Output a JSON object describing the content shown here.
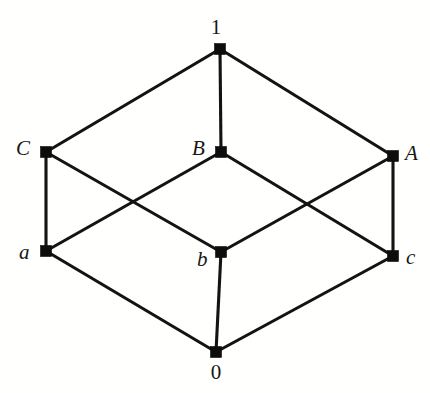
{
  "figure": {
    "background_color": "#ffffff",
    "node_color": "#0d0d0d",
    "edge_color": "#131313",
    "width": 430,
    "height": 393
  },
  "chart_data": {
    "type": "diagram",
    "subtype": "hasse-diagram",
    "nodes": [
      {
        "id": "top",
        "label": "1",
        "style": "upright",
        "x": 220,
        "y": 49,
        "label_x": 216,
        "label_y": 17,
        "label_align": "center"
      },
      {
        "id": "C",
        "label": "C",
        "style": "italic",
        "x": 46,
        "y": 152,
        "label_x": 16,
        "label_y": 138,
        "label_align": "left"
      },
      {
        "id": "B",
        "label": "B",
        "style": "italic",
        "x": 221,
        "y": 152,
        "label_x": 192,
        "label_y": 138,
        "label_align": "left"
      },
      {
        "id": "A",
        "label": "A",
        "style": "italic",
        "x": 393,
        "y": 156,
        "label_x": 405,
        "label_y": 143,
        "label_align": "left"
      },
      {
        "id": "a",
        "label": "a",
        "style": "italic",
        "x": 46,
        "y": 251,
        "label_x": 19,
        "label_y": 242,
        "label_align": "left"
      },
      {
        "id": "b",
        "label": "b",
        "style": "italic",
        "x": 221,
        "y": 252,
        "label_x": 197,
        "label_y": 249,
        "label_align": "left"
      },
      {
        "id": "c",
        "label": "c",
        "style": "italic",
        "x": 393,
        "y": 256,
        "label_x": 406,
        "label_y": 247,
        "label_align": "left"
      },
      {
        "id": "bottom",
        "label": "0",
        "style": "upright",
        "x": 216,
        "y": 352,
        "label_x": 216,
        "label_y": 362,
        "label_align": "center"
      }
    ],
    "node_size": 11,
    "edges": [
      {
        "from": "top",
        "to": "C",
        "name": "edge-1-C"
      },
      {
        "from": "top",
        "to": "B",
        "name": "edge-1-B"
      },
      {
        "from": "top",
        "to": "A",
        "name": "edge-1-A"
      },
      {
        "from": "C",
        "to": "a",
        "name": "edge-C-a"
      },
      {
        "from": "C",
        "to": "b",
        "name": "edge-C-b"
      },
      {
        "from": "B",
        "to": "a",
        "name": "edge-B-a"
      },
      {
        "from": "B",
        "to": "c",
        "name": "edge-B-c"
      },
      {
        "from": "A",
        "to": "b",
        "name": "edge-A-b"
      },
      {
        "from": "A",
        "to": "c",
        "name": "edge-A-c"
      },
      {
        "from": "a",
        "to": "bottom",
        "name": "edge-a-0"
      },
      {
        "from": "b",
        "to": "bottom",
        "name": "edge-b-0"
      },
      {
        "from": "c",
        "to": "bottom",
        "name": "edge-c-0"
      }
    ],
    "levels": [
      {
        "rank": 3,
        "members": [
          "1"
        ]
      },
      {
        "rank": 2,
        "members": [
          "C",
          "B",
          "A"
        ]
      },
      {
        "rank": 1,
        "members": [
          "a",
          "b",
          "c"
        ]
      },
      {
        "rank": 0,
        "members": [
          "0"
        ]
      }
    ]
  }
}
